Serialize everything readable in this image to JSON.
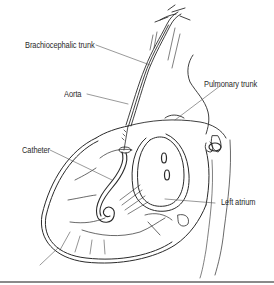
{
  "figure": {
    "type": "anatomical-illustration",
    "labels": [
      {
        "id": "brachiocephalic",
        "text": "Brachiocephalic trunk"
      },
      {
        "id": "aorta",
        "text": "Aorta"
      },
      {
        "id": "pulmonary",
        "text": "Pulmonary trunk"
      },
      {
        "id": "catheter",
        "text": "Catheter"
      },
      {
        "id": "left-atrium",
        "text": "Left atrium"
      }
    ]
  },
  "colors": {
    "line": "#2a2a2a",
    "leader": "#555555",
    "rule": "#8a8a8a",
    "background": "#ffffff"
  }
}
